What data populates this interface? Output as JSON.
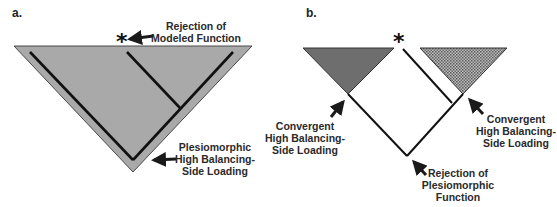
{
  "figure": {
    "panels": [
      {
        "id": "a",
        "letter": "a.",
        "marker": "*",
        "labels": {
          "top_line1": "Rejection of",
          "top_line2": "Modeled Function",
          "bottom_line1": "Plesiomorphic",
          "bottom_line2": "High Balancing-",
          "bottom_line3": "Side Loading"
        }
      },
      {
        "id": "b",
        "letter": "b.",
        "marker": "*",
        "labels": {
          "left_line1": "Convergent",
          "left_line2": "High Balancing-",
          "left_line3": "Side Loading",
          "right_line1": "Convergent",
          "right_line2": "High Balancing-",
          "right_line3": "Side Loading",
          "bottom_line1": "Rejection of",
          "bottom_line2": "Plesiomorphic",
          "bottom_line3": "Function"
        }
      }
    ],
    "colors": {
      "gray_fill": "#a9a9a9",
      "dark_fill": "#6e6e6e",
      "stipple_fill": "#9a9a9a",
      "line": "#1a1a1a"
    }
  }
}
